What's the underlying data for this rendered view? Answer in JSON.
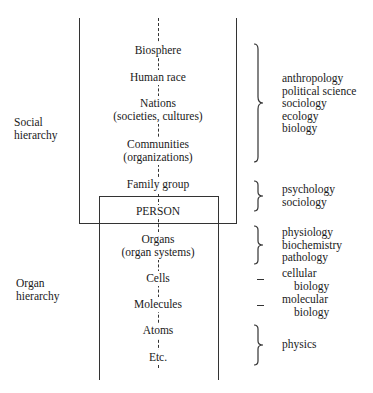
{
  "diagram": {
    "labels": {
      "social": [
        "Social",
        "hierarchy"
      ],
      "organ": [
        "Organ",
        "hierarchy"
      ]
    },
    "levels": [
      {
        "name": "Biosphere",
        "sub": ""
      },
      {
        "name": "Human race",
        "sub": ""
      },
      {
        "name": "Nations",
        "sub": "(societies, cultures)"
      },
      {
        "name": "Communities",
        "sub": "(organizations)"
      },
      {
        "name": "Family group",
        "sub": ""
      },
      {
        "name": "PERSON",
        "sub": ""
      },
      {
        "name": "Organs",
        "sub": "(organ systems)"
      },
      {
        "name": "Cells",
        "sub": ""
      },
      {
        "name": "Molecules",
        "sub": ""
      },
      {
        "name": "Atoms",
        "sub": ""
      },
      {
        "name": "Etc.",
        "sub": ""
      }
    ],
    "disciplines": [
      {
        "connector": "brace",
        "lines": [
          "anthropology",
          "political science",
          "sociology",
          "ecology",
          "biology"
        ]
      },
      {
        "connector": "brace",
        "lines": [
          "psychology",
          "sociology"
        ]
      },
      {
        "connector": "brace",
        "lines": [
          "physiology",
          "biochemistry",
          "pathology"
        ]
      },
      {
        "connector": "dash",
        "lines": [
          "cellular",
          "biology"
        ]
      },
      {
        "connector": "dash",
        "lines": [
          "molecular",
          "biology"
        ]
      },
      {
        "connector": "brace",
        "lines": [
          "physics"
        ]
      }
    ]
  }
}
